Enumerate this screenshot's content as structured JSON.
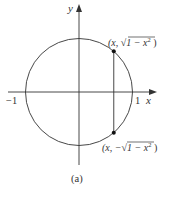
{
  "diagram": {
    "axes": {
      "x_label": "x",
      "y_label": "y",
      "tick_neg_one": "−1",
      "tick_pos_one": "1"
    },
    "circle": {
      "center": [
        0,
        0
      ],
      "radius": 1
    },
    "chord_x": 0.65,
    "points": {
      "upper": {
        "label_prefix": "(x, ",
        "label_sqrt": "√",
        "label_radicand": "1 − x",
        "label_exp": "2",
        "label_suffix": " )"
      },
      "lower": {
        "label_prefix": "(x, −",
        "label_sqrt": "√",
        "label_radicand": "1 − x",
        "label_exp": "2",
        "label_suffix": " )"
      }
    },
    "caption": "(a)",
    "colors": {
      "stroke": "#333333",
      "point": "#111111"
    }
  }
}
